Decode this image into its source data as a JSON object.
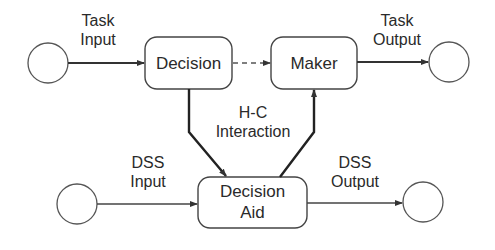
{
  "diagram": {
    "nodes": {
      "decision": {
        "label": "Decision"
      },
      "maker": {
        "label": "Maker"
      },
      "decision_aid": {
        "line1": "Decision",
        "line2": "Aid"
      }
    },
    "labels": {
      "task_input": {
        "line1": "Task",
        "line2": "Input"
      },
      "task_output": {
        "line1": "Task",
        "line2": "Output"
      },
      "hc_interaction": {
        "line1": "H-C",
        "line2": "Interaction"
      },
      "dss_input": {
        "line1": "DSS",
        "line2": "Input"
      },
      "dss_output": {
        "line1": "DSS",
        "line2": "Output"
      }
    },
    "colors": {
      "stroke": "#333333",
      "background": "#ffffff"
    }
  }
}
